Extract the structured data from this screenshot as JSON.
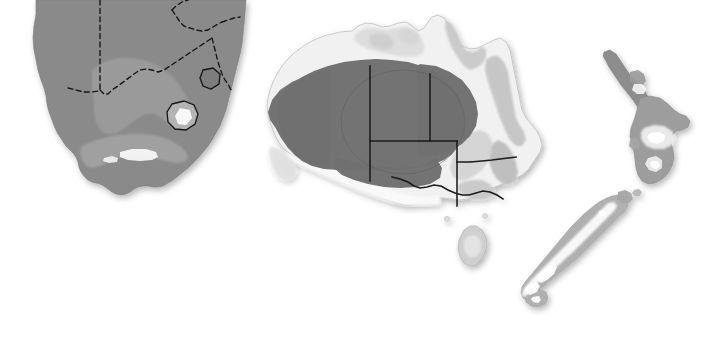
{
  "figure": {
    "width": 712,
    "height": 355,
    "background_color": "#ffffff",
    "style": "greyscale shaded relief with overlaid distribution shading"
  },
  "palette": {
    "background": "#ffffff",
    "land_light": "#f2f2f2",
    "land_mid_light": "#dcdcdc",
    "land_mid": "#c4c4c4",
    "land_grey": "#a9a9a9",
    "range_mid_grey": "#8a8a8a",
    "range_dark_grey": "#6e6e6e",
    "highland_white": "#fbfbfb",
    "coast_line": "#8e8e8e",
    "border_line": "#1a1a1a",
    "dashed_border_line": "#141414",
    "shadow": "#e8e8e8"
  },
  "panels": [
    {
      "id": "southern-africa",
      "name": "Southern Africa",
      "caption": "",
      "bbox": [
        8,
        4,
        265,
        230
      ],
      "regions": [
        {
          "name": "south-africa-mainland",
          "fill": "#8a8a8a",
          "note": "uniform mid-grey distribution shading across the country"
        },
        {
          "name": "interior-plateau-lighter-band",
          "fill": "#9a9a9a",
          "note": "slightly lighter interior / escarpment band"
        },
        {
          "name": "lesotho-enclave",
          "fill": "#b5b5b5",
          "note": "enclave outlined with dark border, pale highland core"
        },
        {
          "name": "eswatini-enclave",
          "fill": "#7f7f7f",
          "note": "small enclave outlined with dark border"
        },
        {
          "name": "cape-fold-white-patch",
          "fill": "#f6f6f6",
          "note": "bright patch in the southern Cape"
        }
      ],
      "borders": {
        "style": "dashed",
        "color": "#141414",
        "note": "international boundaries of Namibia, Botswana, Zimbabwe, Mozambique"
      }
    },
    {
      "id": "australia",
      "name": "Australia",
      "caption": "",
      "bbox": [
        258,
        14,
        300,
        275
      ],
      "regions": [
        {
          "name": "continental-landmass",
          "fill": "#f1f1f1",
          "note": "pale shaded-relief base"
        },
        {
          "name": "distribution-core-dark",
          "fill": "#6e6e6e",
          "note": "large dark grey arid-zone distribution polygon spanning WA, NT, SA, QLD and NSW"
        },
        {
          "name": "inner-ellipse-outline",
          "fill": "none",
          "note": "faint ellipse outline inside the dark core"
        },
        {
          "name": "great-dividing-range",
          "fill": "#c0c0c0",
          "note": "relief shading along the eastern highlands"
        },
        {
          "name": "arnhem-kimberley-relief",
          "fill": "#d8d8d8",
          "note": "northern relief shading"
        },
        {
          "name": "nullarbor-pale",
          "fill": "#fafafa",
          "note": "pale southern coastal strip"
        },
        {
          "name": "tasmania",
          "fill": "#cfcfcf",
          "note": "island south of the mainland"
        }
      ],
      "borders": {
        "style": "solid",
        "color": "#1a1a1a",
        "note": "straight state boundaries: WA/NT/SA meridians and parallels, plus the NSW/VIC river boundary"
      }
    },
    {
      "id": "new-zealand",
      "name": "New Zealand",
      "caption": "",
      "bbox": [
        520,
        44,
        190,
        270
      ],
      "regions": [
        {
          "name": "north-island",
          "fill": "#9a9a9a",
          "note": "mid grey island with darker northern peninsula"
        },
        {
          "name": "northland-peninsula",
          "fill": "#8c8c8c",
          "note": "narrow dark peninsula running to the north-west"
        },
        {
          "name": "central-volcanic-plateau",
          "fill": "#efefef",
          "note": "pale highland core of the North Island"
        },
        {
          "name": "lake-taupo",
          "fill": "#ffffff",
          "note": "small white lake shape"
        },
        {
          "name": "south-island",
          "fill": "#b0b0b0",
          "note": "elongated island running north-east to south-west"
        },
        {
          "name": "southern-alps",
          "fill": "#fbfbfb",
          "note": "bright white mountain spine along the South Island"
        },
        {
          "name": "fiordland-lakes",
          "fill": "#ffffff",
          "note": "small white lake shapes in the south-west"
        }
      ],
      "borders": {
        "style": "none",
        "color": "#8e8e8e",
        "note": "no internal political boundaries shown"
      }
    }
  ],
  "legend": {
    "present": false,
    "items": []
  },
  "labels": {
    "present": false,
    "items": []
  }
}
